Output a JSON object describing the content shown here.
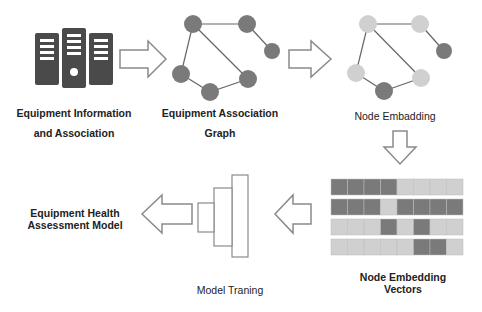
{
  "stages": {
    "equipment_info": {
      "line1": "Equipment Information",
      "line2": "and Association"
    },
    "association_graph": {
      "line1": "Equipment Association",
      "line2": "Graph"
    },
    "node_embedding": {
      "label": "Node Embadding"
    },
    "embedding_vectors": {
      "line1": "Node Embedding",
      "line2": "Vectors"
    },
    "model_training": {
      "label": "Model Traning"
    },
    "health_model": {
      "line1": "Equipment Health",
      "line2": "Assessment Model"
    }
  },
  "colors": {
    "dark": "#7a7a7a",
    "light": "#d0d0d0",
    "server": "#4a4a4a",
    "outline": "#8a8a8a"
  },
  "vectors": [
    [
      "d",
      "d",
      "d",
      "d",
      "l",
      "l",
      "l",
      "l"
    ],
    [
      "d",
      "d",
      "d",
      "l",
      "d",
      "d",
      "d",
      "d"
    ],
    [
      "l",
      "l",
      "l",
      "d",
      "l",
      "d",
      "l",
      "l"
    ],
    [
      "l",
      "l",
      "l",
      "l",
      "l",
      "d",
      "d",
      "l"
    ]
  ]
}
